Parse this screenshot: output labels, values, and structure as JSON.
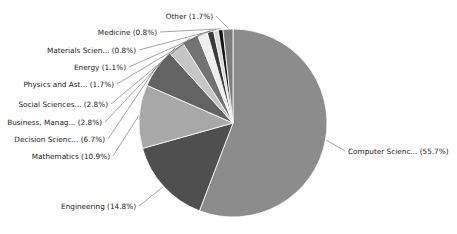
{
  "figure": {
    "background": "#ffffff"
  },
  "chart_data": {
    "type": "pie",
    "title": "",
    "legend": "none",
    "grid": false,
    "start_angle_deg": 90,
    "direction": "clockwise",
    "center": [
      233,
      123
    ],
    "radius": 94,
    "label_font_px": 7.3,
    "label_color": "#1a1a1a",
    "leader_color": "#555555",
    "wedge_edge_color": "#ffffff",
    "slices": [
      {
        "label": "Computer Scienc... (55.7%)",
        "pct": 55.7,
        "color": "#8c8c8c",
        "anchor": [
          348,
          154
        ],
        "align": "start"
      },
      {
        "label": "Engineering (14.8%)",
        "pct": 14.8,
        "color": "#4f4f4f",
        "anchor": [
          136,
          209
        ],
        "align": "end"
      },
      {
        "label": "Mathematics (10.9%)",
        "pct": 10.9,
        "color": "#a8a8a8",
        "anchor": [
          110,
          159
        ],
        "align": "end"
      },
      {
        "label": "Decision Scienc... (6.7%)",
        "pct": 6.7,
        "color": "#636363",
        "anchor": [
          105,
          142
        ],
        "align": "end"
      },
      {
        "label": "Business, Manag... (2.8%)",
        "pct": 2.8,
        "color": "#c6c6c6",
        "anchor": [
          102,
          125
        ],
        "align": "end"
      },
      {
        "label": "Social Sciences... (2.8%)",
        "pct": 2.8,
        "color": "#737373",
        "anchor": [
          108,
          107
        ],
        "align": "end"
      },
      {
        "label": "Physics and Ast... (1.7%)",
        "pct": 1.7,
        "color": "#efefef",
        "anchor": [
          114,
          87
        ],
        "align": "end"
      },
      {
        "label": "Energy (1.1%)",
        "pct": 1.1,
        "color": "#3c3c3c",
        "anchor": [
          126,
          70
        ],
        "align": "end"
      },
      {
        "label": "Materials Scien... (0.8%)",
        "pct": 0.8,
        "color": "#d9d9d9",
        "anchor": [
          136,
          53
        ],
        "align": "end"
      },
      {
        "label": "Medicine (0.8%)",
        "pct": 0.8,
        "color": "#161616",
        "anchor": [
          157,
          35
        ],
        "align": "end"
      },
      {
        "label": "Other (1.7%)",
        "pct": 1.7,
        "color": "#7d7d7d",
        "anchor": [
          213,
          19
        ],
        "align": "end"
      }
    ]
  }
}
